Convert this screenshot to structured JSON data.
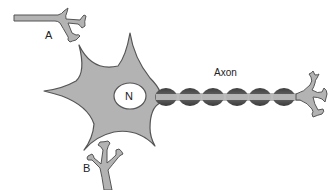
{
  "diagram": {
    "title": "",
    "labels": {
      "a": "A",
      "b": "B",
      "nucleus": "N",
      "axon": "Axon"
    },
    "components": [
      {
        "id": "neuron-a-terminal",
        "label": "A",
        "description": "Axon terminal of a presynaptic neuron near the top-left"
      },
      {
        "id": "cell-body",
        "label": "",
        "description": "Star-shaped soma with tapering dendrites"
      },
      {
        "id": "nucleus",
        "label": "N",
        "description": "Oval nucleus inside the cell body"
      },
      {
        "id": "axon",
        "label": "Axon",
        "description": "Axon with six myelin sheath segments"
      },
      {
        "id": "axon-terminal",
        "label": "",
        "description": "Branched axon terminals at the right end"
      },
      {
        "id": "neuron-b-dendrite",
        "label": "B",
        "description": "Branched dendrite of a postsynaptic neuron below the cell body"
      }
    ],
    "myelin_segment_count": 6,
    "colors": {
      "cell_fill": "#b3b3b3",
      "outline": "#555555",
      "nucleus_fill": "#ffffff",
      "myelin": "#555555",
      "axon_core": "#b8b8b8",
      "text": "#222222",
      "background": "#ffffff"
    }
  }
}
